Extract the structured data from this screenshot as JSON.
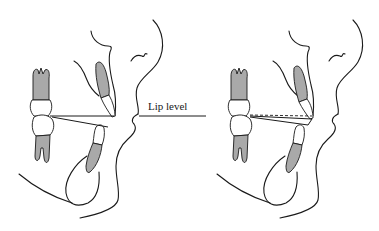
{
  "figure": {
    "label": "Lip level",
    "panels": [
      {
        "name": "left-panel",
        "description": "Profile with molar pair, upper and lower incisors; occlusal plane lines meeting at lower incisor tip"
      },
      {
        "name": "right-panel",
        "description": "Profile with molar pair, upper and lower incisors; dashed line indicating altered occlusal plane"
      }
    ],
    "colors": {
      "line": "#1a1a1a",
      "root_fill": "#a9a9a9",
      "background": "#ffffff"
    }
  }
}
